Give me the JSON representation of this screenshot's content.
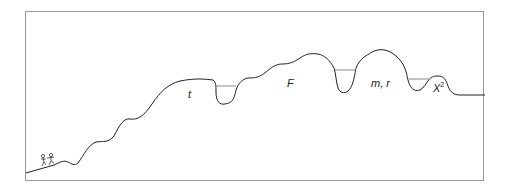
{
  "diagram": {
    "type": "landscape-path",
    "labels": {
      "t": "t",
      "F": "F",
      "mr": "m, r",
      "chi_base": "X",
      "chi_sup": "2"
    },
    "colors": {
      "line": "#222222",
      "frame": "#9a9a9a",
      "water": "#888888"
    }
  }
}
